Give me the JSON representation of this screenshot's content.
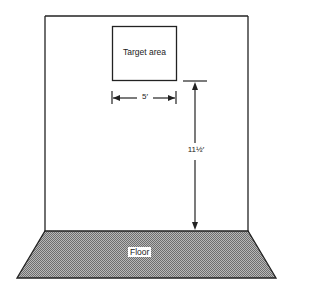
{
  "diagram": {
    "target_label": "Target area",
    "width_dimension": "5′",
    "height_dimension": "11½′",
    "floor_label": "Floor",
    "colors": {
      "line": "#222222",
      "floor_fill": "#9a9a9a",
      "background": "#ffffff"
    }
  }
}
